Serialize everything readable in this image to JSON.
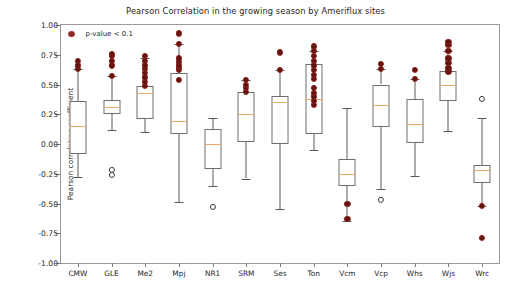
{
  "chart_data": {
    "type": "boxplot",
    "title": "Pearson Correlation in the growing season by Ameriflux sites",
    "xlabel": "",
    "ylabel": "Pearson correlation coefficient",
    "ylim": [
      -1.0,
      1.0
    ],
    "yticks": [
      1.0,
      0.75,
      0.5,
      0.25,
      0.0,
      -0.25,
      -0.5,
      -0.75,
      -1.0
    ],
    "ytick_labels": [
      "1.00",
      "0.75",
      "0.50",
      "0.25",
      "0.00",
      "-0.25",
      "-0.50",
      "-0.75",
      "-1.00"
    ],
    "grid": false,
    "legend": {
      "position": "upper-left-inside",
      "entries": [
        {
          "label": "p-value < 0.1",
          "marker": "circle",
          "color": "#8c2a22"
        }
      ]
    },
    "categories": [
      "CMW",
      "GLE",
      "Me2",
      "Mpj",
      "NR1",
      "SRM",
      "Ses",
      "Ton",
      "Vcm",
      "Vcp",
      "Whs",
      "Wjs",
      "Wrc"
    ],
    "boxes": [
      {
        "site": "CMW",
        "whisker_low": -0.28,
        "q1": -0.08,
        "median": 0.15,
        "q3": 0.36,
        "whisker_high": 0.63,
        "significant_points": [
          0.63,
          0.66,
          0.7
        ],
        "outliers": []
      },
      {
        "site": "GLE",
        "whisker_low": 0.12,
        "q1": 0.25,
        "median": 0.31,
        "q3": 0.37,
        "whisker_high": 0.57,
        "significant_points": [
          0.57,
          0.66,
          0.7,
          0.74,
          0.76
        ],
        "outliers": [
          -0.22,
          -0.26
        ]
      },
      {
        "site": "Me2",
        "whisker_low": 0.1,
        "q1": 0.21,
        "median": 0.43,
        "q3": 0.49,
        "whisker_high": 0.72,
        "significant_points": [
          0.49,
          0.52,
          0.56,
          0.6,
          0.63,
          0.66,
          0.7,
          0.74
        ],
        "outliers": []
      },
      {
        "site": "Mpj",
        "whisker_low": -0.49,
        "q1": 0.08,
        "median": 0.19,
        "q3": 0.6,
        "whisker_high": 0.84,
        "significant_points": [
          0.54,
          0.62,
          0.64,
          0.66,
          0.69,
          0.72,
          0.84,
          0.93
        ],
        "outliers": []
      },
      {
        "site": "NR1",
        "whisker_low": -0.35,
        "q1": -0.21,
        "median": 0.0,
        "q3": 0.13,
        "whisker_high": 0.22,
        "significant_points": [],
        "outliers": [
          -0.53
        ]
      },
      {
        "site": "SRM",
        "whisker_low": -0.29,
        "q1": 0.02,
        "median": 0.25,
        "q3": 0.44,
        "whisker_high": 0.54,
        "significant_points": [
          0.44,
          0.47,
          0.5,
          0.54
        ],
        "outliers": []
      },
      {
        "site": "Ses",
        "whisker_low": -0.55,
        "q1": 0.0,
        "median": 0.35,
        "q3": 0.4,
        "whisker_high": 0.62,
        "significant_points": [
          0.62,
          0.77
        ],
        "outliers": []
      },
      {
        "site": "Ton",
        "whisker_low": -0.05,
        "q1": 0.08,
        "median": 0.38,
        "q3": 0.67,
        "whisker_high": 0.78,
        "significant_points": [
          0.33,
          0.36,
          0.4,
          0.43,
          0.47,
          0.55,
          0.58,
          0.62,
          0.66,
          0.7,
          0.74,
          0.78,
          0.82
        ],
        "outliers": []
      },
      {
        "site": "Vcm",
        "whisker_low": -0.65,
        "q1": -0.35,
        "median": -0.25,
        "q3": -0.13,
        "whisker_high": 0.3,
        "significant_points": [
          -0.5,
          -0.63
        ],
        "outliers": []
      },
      {
        "site": "Vcp",
        "whisker_low": -0.38,
        "q1": 0.14,
        "median": 0.33,
        "q3": 0.5,
        "whisker_high": 0.63,
        "significant_points": [
          0.63,
          0.67
        ],
        "outliers": [
          -0.47
        ]
      },
      {
        "site": "Whs",
        "whisker_low": -0.27,
        "q1": 0.01,
        "median": 0.17,
        "q3": 0.38,
        "whisker_high": 0.55,
        "significant_points": [
          0.55,
          0.62
        ],
        "outliers": []
      },
      {
        "site": "Wjs",
        "whisker_low": 0.11,
        "q1": 0.36,
        "median": 0.5,
        "q3": 0.61,
        "whisker_high": 0.78,
        "significant_points": [
          0.61,
          0.64,
          0.68,
          0.72,
          0.78,
          0.83,
          0.86
        ],
        "outliers": []
      },
      {
        "site": "Wrc",
        "whisker_low": -0.52,
        "q1": -0.33,
        "median": -0.22,
        "q3": -0.18,
        "whisker_high": 0.22,
        "significant_points": [
          -0.52,
          -0.79
        ],
        "outliers": [
          0.38
        ]
      }
    ]
  },
  "legend": {
    "label": "p-value < 0.1"
  },
  "colors": {
    "significant_point": "#5e1512",
    "significant_point_edge": "#8c1f19",
    "median": "#e8a96b",
    "box_edge": "#6e6e6e",
    "whisker": "#5a5a5a",
    "axis": "#9a9a9a",
    "text": "#262626",
    "background": "#ffffff"
  }
}
